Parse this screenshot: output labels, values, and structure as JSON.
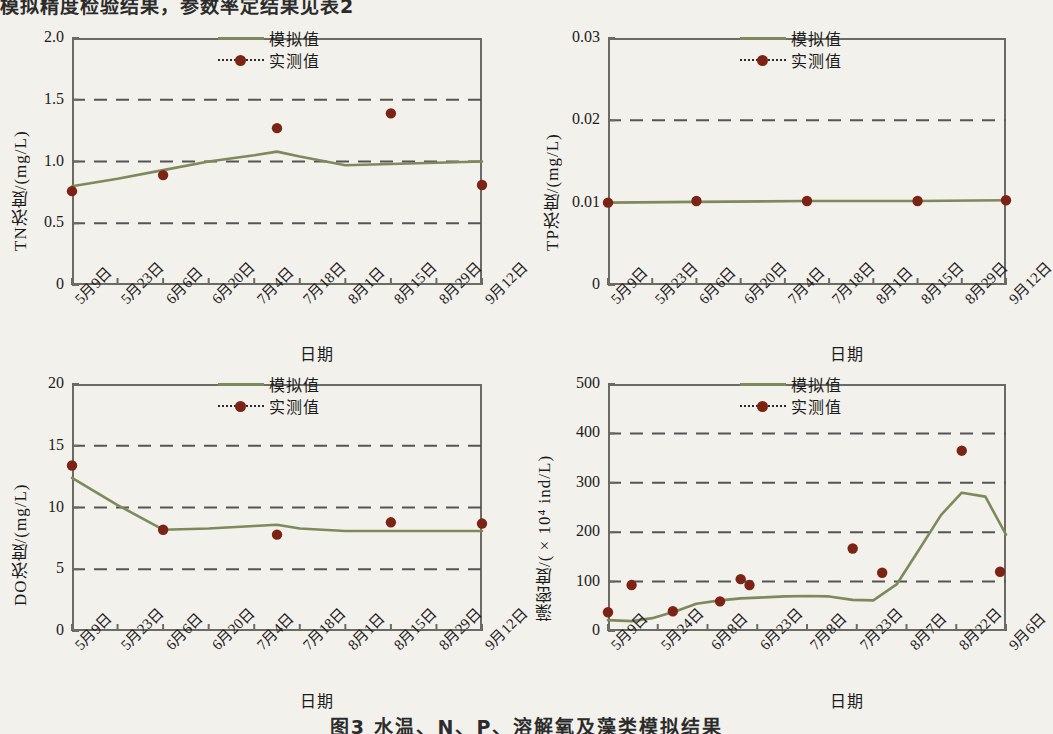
{
  "page": {
    "top_text_fragment": "模拟精度检验结果，参数率定结果见表2",
    "caption_fragment": "图3  水温、N、P、溶解氧及藻类模拟结果"
  },
  "legend": {
    "simulated_label": "模拟值",
    "measured_label": "实测值",
    "simulated_color": "#7d8a5c",
    "measured_color": "#7b2416",
    "measured_line_color": "#2a2a2a"
  },
  "common": {
    "xlabel": "日期",
    "dates_14d": [
      "5月9日",
      "5月23日",
      "6月6日",
      "6月20日",
      "7月4日",
      "7月18日",
      "8月1日",
      "8月15日",
      "8月29日",
      "9月12日"
    ],
    "dates_15d": [
      "5月9日",
      "5月24日",
      "6月8日",
      "6月23日",
      "7月8日",
      "7月23日",
      "8月7日",
      "8月22日",
      "9月6日"
    ]
  },
  "chart_data": [
    {
      "id": "tn",
      "type": "line",
      "title": "",
      "ylabel": "TN浓度/(mg/L)",
      "xlabel": "日期",
      "ylim": [
        0,
        2.0
      ],
      "yticks": [
        0,
        0.5,
        1.0,
        1.5,
        2.0
      ],
      "ytick_labels": [
        "0",
        "0.5",
        "1.0",
        "1.5",
        "2.0"
      ],
      "gridlines": [
        0.5,
        1.0,
        1.5
      ],
      "grid": true,
      "legend_position": "top-right",
      "xlim_days": [
        0,
        126
      ],
      "categories": [
        "5月9日",
        "5月23日",
        "6月6日",
        "6月20日",
        "7月4日",
        "7月18日",
        "8月1日",
        "8月15日",
        "8月29日",
        "9月12日"
      ],
      "series": [
        {
          "name": "模拟值",
          "type": "line",
          "x_days": [
            0,
            14,
            28,
            42,
            56,
            63,
            70,
            84,
            98,
            112,
            126
          ],
          "values": [
            0.8,
            0.86,
            0.93,
            1.0,
            1.05,
            1.08,
            1.04,
            0.97,
            0.98,
            0.99,
            1.0
          ]
        },
        {
          "name": "实测值",
          "type": "scatter",
          "x_days": [
            0,
            28,
            63,
            98,
            126
          ],
          "values": [
            0.76,
            0.89,
            1.27,
            1.39,
            0.81
          ]
        }
      ]
    },
    {
      "id": "tp",
      "type": "line",
      "title": "",
      "ylabel": "TP浓度/(mg/L)",
      "xlabel": "日期",
      "ylim": [
        0,
        0.03
      ],
      "yticks": [
        0,
        0.01,
        0.02,
        0.03
      ],
      "ytick_labels": [
        "0",
        "0.01",
        "0.02",
        "0.03"
      ],
      "gridlines": [
        0.02
      ],
      "grid": true,
      "legend_position": "top-right",
      "xlim_days": [
        0,
        126
      ],
      "categories": [
        "5月9日",
        "5月23日",
        "6月6日",
        "6月20日",
        "7月4日",
        "7月18日",
        "8月1日",
        "8月15日",
        "8月29日",
        "9月12日"
      ],
      "series": [
        {
          "name": "模拟值",
          "type": "line",
          "x_days": [
            0,
            28,
            63,
            98,
            126
          ],
          "values": [
            0.01,
            0.0101,
            0.0102,
            0.0102,
            0.0103
          ]
        },
        {
          "name": "实测值",
          "type": "scatter",
          "x_days": [
            0,
            28,
            63,
            98,
            126
          ],
          "values": [
            0.01,
            0.0102,
            0.0102,
            0.0102,
            0.0103
          ]
        }
      ]
    },
    {
      "id": "do",
      "type": "line",
      "title": "",
      "ylabel": "DO浓度/(mg/L)",
      "xlabel": "日期",
      "ylim": [
        0,
        20
      ],
      "yticks": [
        0,
        5,
        10,
        15,
        20
      ],
      "ytick_labels": [
        "0",
        "5",
        "10",
        "15",
        "20"
      ],
      "gridlines": [
        5,
        10,
        15
      ],
      "grid": true,
      "legend_position": "top-right",
      "xlim_days": [
        0,
        126
      ],
      "categories": [
        "5月9日",
        "5月23日",
        "6月6日",
        "6月20日",
        "7月4日",
        "7月18日",
        "8月1日",
        "8月15日",
        "8月29日",
        "9月12日"
      ],
      "series": [
        {
          "name": "模拟值",
          "type": "line",
          "x_days": [
            0,
            14,
            28,
            42,
            56,
            63,
            70,
            84,
            98,
            112,
            126
          ],
          "values": [
            12.4,
            10.2,
            8.2,
            8.3,
            8.5,
            8.6,
            8.3,
            8.1,
            8.1,
            8.1,
            8.1
          ]
        },
        {
          "name": "实测值",
          "type": "scatter",
          "x_days": [
            0,
            28,
            63,
            98,
            126
          ],
          "values": [
            13.4,
            8.2,
            7.8,
            8.8,
            8.7
          ]
        }
      ]
    },
    {
      "id": "algae",
      "type": "line",
      "title": "",
      "ylabel": "藻密度/(×10⁴ ind/L)",
      "xlabel": "日期",
      "ylim": [
        0,
        500
      ],
      "yticks": [
        0,
        100,
        200,
        300,
        400,
        500
      ],
      "ytick_labels": [
        "0",
        "100",
        "200",
        "300",
        "400",
        "500"
      ],
      "gridlines": [
        100,
        200,
        300,
        400
      ],
      "grid": true,
      "legend_position": "top-right",
      "xlim_days": [
        0,
        135
      ],
      "categories": [
        "5月9日",
        "5月24日",
        "6月8日",
        "6月23日",
        "7月8日",
        "7月23日",
        "8月7日",
        "8月22日",
        "9月6日"
      ],
      "series": [
        {
          "name": "模拟值",
          "type": "line",
          "x_days": [
            0,
            8,
            15,
            23,
            30,
            38,
            45,
            53,
            60,
            68,
            75,
            83,
            90,
            98,
            105,
            113,
            120,
            128,
            135
          ],
          "values": [
            22,
            20,
            26,
            40,
            55,
            62,
            66,
            68,
            70,
            71,
            70,
            63,
            62,
            95,
            160,
            235,
            280,
            272,
            195
          ]
        },
        {
          "name": "实测值",
          "type": "scatter",
          "x_days": [
            0,
            8,
            22,
            38,
            45,
            48,
            83,
            93,
            120,
            133
          ],
          "values": [
            38,
            93,
            40,
            60,
            105,
            93,
            167,
            118,
            365,
            120
          ]
        }
      ]
    }
  ]
}
